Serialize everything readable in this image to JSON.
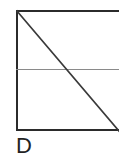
{
  "figure": {
    "label": "D",
    "canvas": {
      "width": 119,
      "height": 161,
      "background_color": "#ffffff"
    },
    "shape": {
      "name": "rectangle-with-diagonal-and-divider",
      "outline_color": "#2b2b2b",
      "outline_width_px": 2,
      "fill": "none",
      "left_px": 16,
      "top_px": 10,
      "width_px": 110,
      "height_px": 121,
      "right_edge_clipped": true
    },
    "divider": {
      "name": "horizontal-divider",
      "color": "#8a8a8a",
      "width_px": 1,
      "y_px": 69,
      "x_start_px": 16,
      "x_end_px": 119
    },
    "diagonal": {
      "name": "diagonal-line",
      "color": "#3a3a3a",
      "width_px": 1.6,
      "x1": 17,
      "y1": 11,
      "x2": 119,
      "y2": 131
    },
    "label_style": {
      "color": "#232323",
      "font_size_px": 22
    }
  }
}
